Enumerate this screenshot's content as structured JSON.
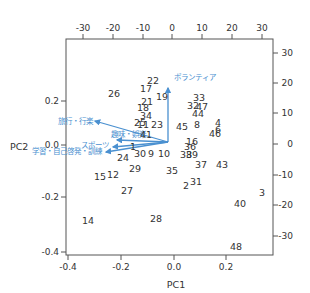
{
  "chart_data": {
    "type": "scatter",
    "subtype": "pca-biplot",
    "title": "",
    "xlabel": "PC1",
    "ylabel": "PC2",
    "xlim": [
      -0.41,
      0.37
    ],
    "ylim": [
      -0.41,
      0.42
    ],
    "x_ticks": [
      "-0.4",
      "-0.2",
      "0.0",
      "0.2"
    ],
    "y_ticks": [
      "0.2",
      "0.0",
      "-0.2",
      "-0.4"
    ],
    "top_ticks": [
      "-30",
      "-20",
      "-10",
      "0",
      "10",
      "20",
      "30"
    ],
    "right_ticks": [
      "30",
      "20",
      "10",
      "0",
      "-10",
      "-20",
      "-30"
    ],
    "grid": false,
    "legend": null,
    "arrow_color": "#4a90d0",
    "points": [
      {
        "label": "1",
        "x": -0.078,
        "y": -0.035
      },
      {
        "label": "2",
        "x": 0.06,
        "y": -0.112
      },
      {
        "label": "3",
        "x": 0.35,
        "y": -0.173
      },
      {
        "label": "4",
        "x": 0.18,
        "y": 0.1
      },
      {
        "label": "6",
        "x": 0.18,
        "y": 0.08
      },
      {
        "label": "8",
        "x": 0.095,
        "y": 0.08
      },
      {
        "label": "9",
        "x": -0.055,
        "y": -0.025
      },
      {
        "label": "10",
        "x": -0.015,
        "y": -0.025
      },
      {
        "label": "11",
        "x": -0.01,
        "y": 0.08
      },
      {
        "label": "12",
        "x": -0.2,
        "y": -0.05
      },
      {
        "label": "14",
        "x": -0.33,
        "y": -0.28
      },
      {
        "label": "15",
        "x": -0.27,
        "y": -0.05
      },
      {
        "label": "16",
        "x": 0.085,
        "y": 0.01
      },
      {
        "label": "17",
        "x": -0.085,
        "y": 0.225
      },
      {
        "label": "18",
        "x": -0.09,
        "y": 0.145
      },
      {
        "label": "19",
        "x": -0.06,
        "y": 0.175
      },
      {
        "label": "21",
        "x": -0.07,
        "y": 0.16
      },
      {
        "label": "22",
        "x": -0.06,
        "y": 0.24
      },
      {
        "label": "23",
        "x": -0.01,
        "y": 0.09
      },
      {
        "label": "24",
        "x": -0.165,
        "y": -0.01
      },
      {
        "label": "25",
        "x": -0.1,
        "y": 0.09
      },
      {
        "label": "26",
        "x": -0.22,
        "y": 0.2
      },
      {
        "label": "27",
        "x": -0.155,
        "y": -0.148
      },
      {
        "label": "28",
        "x": -0.07,
        "y": -0.265
      },
      {
        "label": "29",
        "x": -0.1,
        "y": -0.04
      },
      {
        "label": "30",
        "x": -0.08,
        "y": 0.09
      },
      {
        "label": "31",
        "x": 0.08,
        "y": -0.1
      },
      {
        "label": "32",
        "x": 0.15,
        "y": 0.15
      },
      {
        "label": "33",
        "x": 0.12,
        "y": 0.175
      },
      {
        "label": "34",
        "x": -0.085,
        "y": 0.11
      },
      {
        "label": "35",
        "x": 0.01,
        "y": -0.045
      },
      {
        "label": "36",
        "x": 0.085,
        "y": 0.0
      },
      {
        "label": "37",
        "x": 0.115,
        "y": -0.04
      },
      {
        "label": "38",
        "x": 0.075,
        "y": -0.025
      },
      {
        "label": "39",
        "x": 0.09,
        "y": -0.025
      },
      {
        "label": "40",
        "x": 0.26,
        "y": -0.19
      },
      {
        "label": "41",
        "x": -0.08,
        "y": 0.04
      },
      {
        "label": "43",
        "x": 0.17,
        "y": -0.04
      },
      {
        "label": "44",
        "x": 0.11,
        "y": 0.135
      },
      {
        "label": "45",
        "x": 0.04,
        "y": 0.085
      },
      {
        "label": "46",
        "x": 0.165,
        "y": 0.06
      },
      {
        "label": "47",
        "x": 0.12,
        "y": 0.155
      },
      {
        "label": "48",
        "x": 0.24,
        "y": -0.385
      }
    ],
    "loadings": [
      {
        "label": "ボランティア",
        "x": -0.02,
        "y": 0.19
      },
      {
        "label": "旅行・行楽",
        "x": -0.28,
        "y": 0.095
      },
      {
        "label": "趣味・娯楽",
        "x": -0.115,
        "y": 0.012
      },
      {
        "label": "スポーツ",
        "x": -0.16,
        "y": -0.005
      },
      {
        "label": "学習・自己啓発・訓練",
        "x": -0.21,
        "y": -0.035
      }
    ],
    "loading_origin": {
      "x": 0.0,
      "y": 0.0
    }
  }
}
